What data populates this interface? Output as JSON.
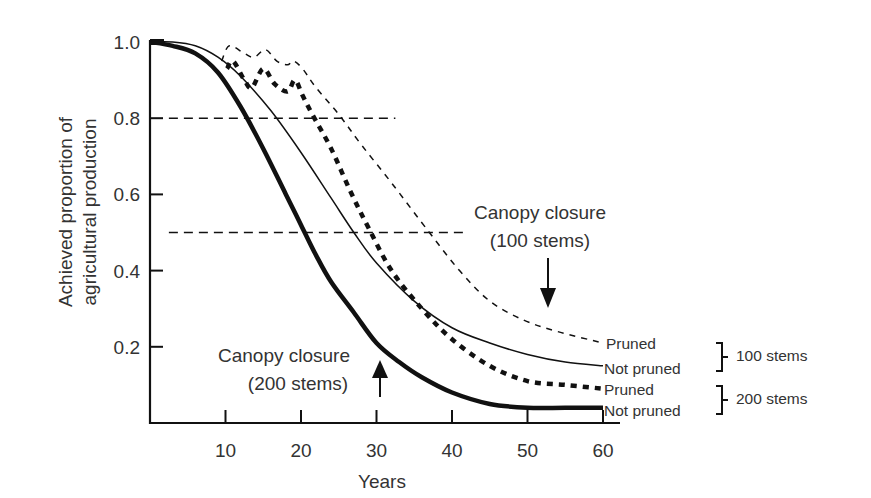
{
  "chart_data": {
    "type": "line",
    "title": "",
    "xlabel": "Years",
    "ylabel": [
      "Achieved proportion of",
      "agricultural production"
    ],
    "xlim": [
      0,
      62
    ],
    "ylim": [
      0,
      1.0
    ],
    "x_ticks": [
      10,
      20,
      30,
      40,
      50,
      60
    ],
    "x_tick_labels": [
      "10",
      "20",
      "30",
      "40",
      "50",
      "60"
    ],
    "y_ticks": [
      0.2,
      0.4,
      0.6,
      0.8,
      1.0
    ],
    "y_tick_labels": [
      "0.2",
      "0.4",
      "0.6",
      "0.8",
      "1.0"
    ],
    "grid": false,
    "reference_lines": [
      {
        "y": 0.8,
        "x_from": 2.5,
        "x_to": 32.5,
        "style": "dashed"
      },
      {
        "y": 0.5,
        "x_from": 2.5,
        "x_to": 42,
        "style": "dashed"
      }
    ],
    "series": [
      {
        "name": "100 stems - Pruned",
        "legend_label": "Pruned",
        "group": "100 stems",
        "style": "thin-dashed",
        "x": [
          9.5,
          10.5,
          12.5,
          13.8,
          15.3,
          16.8,
          18.2,
          19.0,
          20.2,
          22.0,
          25.0,
          28.0,
          32.0,
          37.0,
          41.0,
          45.0,
          49.5,
          54.0,
          60.0
        ],
        "y": [
          0.95,
          0.99,
          0.97,
          0.96,
          0.98,
          0.95,
          0.94,
          0.95,
          0.93,
          0.88,
          0.81,
          0.73,
          0.63,
          0.5,
          0.4,
          0.32,
          0.27,
          0.24,
          0.21
        ]
      },
      {
        "name": "100 stems - Not pruned",
        "legend_label": "Not pruned",
        "group": "100 stems",
        "style": "thin-solid",
        "x": [
          0,
          3,
          6,
          9,
          12,
          16,
          20,
          24,
          27,
          30,
          35,
          40,
          45,
          50,
          55,
          60
        ],
        "y": [
          1.0,
          1.0,
          0.99,
          0.96,
          0.91,
          0.82,
          0.71,
          0.59,
          0.5,
          0.42,
          0.32,
          0.25,
          0.21,
          0.18,
          0.16,
          0.15
        ]
      },
      {
        "name": "200 stems - Pruned",
        "legend_label": "Pruned",
        "group": "200 stems",
        "style": "thick-dashed",
        "x": [
          10.2,
          11.0,
          12.5,
          13.5,
          15.0,
          16.5,
          18.2,
          19.2,
          20.2,
          21.5,
          24.0,
          26.5,
          29.0,
          32.0,
          36.0,
          40.0,
          45.0,
          50.0,
          55.0,
          60.0
        ],
        "y": [
          0.93,
          0.95,
          0.9,
          0.88,
          0.93,
          0.89,
          0.87,
          0.9,
          0.86,
          0.81,
          0.72,
          0.61,
          0.51,
          0.4,
          0.3,
          0.22,
          0.15,
          0.11,
          0.1,
          0.09
        ]
      },
      {
        "name": "200 stems - Not pruned",
        "legend_label": "Not pruned",
        "group": "200 stems",
        "style": "thick-solid",
        "x": [
          0,
          3,
          6,
          9,
          12,
          15,
          18,
          20,
          22,
          24,
          27,
          30,
          33,
          36,
          40,
          45,
          50,
          55,
          60
        ],
        "y": [
          1.0,
          0.99,
          0.97,
          0.92,
          0.83,
          0.72,
          0.6,
          0.52,
          0.44,
          0.37,
          0.29,
          0.21,
          0.16,
          0.12,
          0.08,
          0.05,
          0.04,
          0.04,
          0.04
        ]
      }
    ],
    "annotations": [
      {
        "text": [
          "Canopy closure",
          "(100 stems)"
        ],
        "arrow": "down",
        "arrow_x": 53,
        "arrow_y_from": 0.43,
        "arrow_y_to": 0.3
      },
      {
        "text": [
          "Canopy closure",
          "(200 stems)"
        ],
        "arrow": "up",
        "arrow_x": 30.5,
        "arrow_y_from": 0.07,
        "arrow_y_to": 0.16
      }
    ],
    "legend": {
      "position": "right",
      "groups": [
        {
          "bracket_label": "100 stems",
          "entries": [
            "Pruned",
            "Not pruned"
          ]
        },
        {
          "bracket_label": "200 stems",
          "entries": [
            "Pruned",
            "Not pruned"
          ]
        }
      ]
    }
  },
  "colors": {
    "line": "#111111",
    "text": "#333333",
    "background": "#ffffff"
  }
}
